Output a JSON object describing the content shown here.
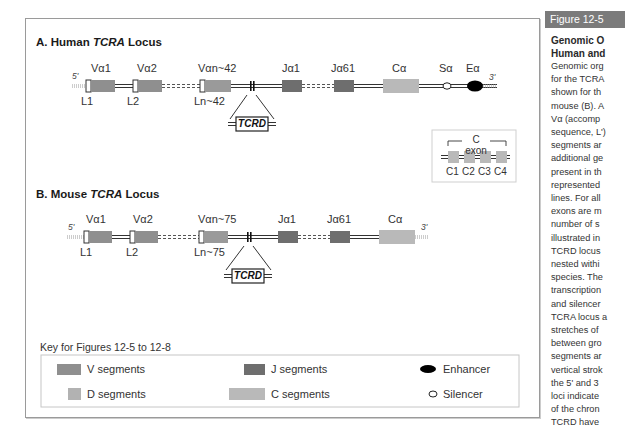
{
  "figure_tag": "Figure 12-5",
  "caption": {
    "title_lines": [
      "Genomic O",
      "Human and"
    ],
    "body_lines": [
      "Genomic org",
      "for the TCRA",
      "shown for th",
      "mouse (B). A",
      "Vα (accomp",
      "sequence, L')",
      "segments ar",
      "additional ge",
      "present in th",
      "represented",
      "lines. For all",
      "exons are m",
      "number of s",
      "illustrated in",
      "TCRD locus",
      "nested withi",
      "species. The",
      "transcription",
      "and silencer",
      "TCRA locus a",
      "stretches of",
      "between gro",
      "segments ar",
      "vertical strok",
      "the 5' and 3",
      "loci indicate",
      "of the chron",
      "TCRD have"
    ]
  },
  "human": {
    "title_prefix": "A.  Human ",
    "title_gene": "TCRA",
    "title_suffix": " Locus",
    "five_prime": "5'",
    "three_prime": "3'",
    "segments": {
      "va1": "Vα1",
      "va2": "Vα2",
      "van": "Vαn~42",
      "ja1": "Jα1",
      "ja61": "Jα61",
      "ca": "Cα",
      "sa": "Sα",
      "ea": "Eα"
    },
    "leaders": {
      "l1": "L1",
      "l2": "L2",
      "ln": "Ln~42"
    },
    "tcrd": "TCRD"
  },
  "cexon_inset": {
    "title": "C exon",
    "exons": [
      "C1",
      "C2",
      "C3",
      "C4"
    ]
  },
  "mouse": {
    "title_prefix": "B.  Mouse ",
    "title_gene": "TCRA",
    "title_suffix": " Locus",
    "five_prime": "5'",
    "three_prime": "3'",
    "segments": {
      "va1": "Vα1",
      "va2": "Vα2",
      "van": "Vαn~75",
      "ja1": "Jα1",
      "ja61": "Jα61",
      "ca": "Cα"
    },
    "leaders": {
      "l1": "L1",
      "l2": "L2",
      "ln": "Ln~75"
    },
    "tcrd": "TCRD"
  },
  "key": {
    "title": "Key for Figures 12-5 to 12-8",
    "items": {
      "v": "V segments",
      "j": "J segments",
      "enh": "Enhancer",
      "d": "D segments",
      "c": "C segments",
      "sil": "Silencer"
    }
  },
  "colors": {
    "v_segment": "#8f8f8f",
    "j_segment": "#6e6e6e",
    "d_segment": "#b2b2b2",
    "c_segment": "#b9b9b9",
    "enhancer": "#000000",
    "figure_tag_bg": "#7b7b7b"
  }
}
